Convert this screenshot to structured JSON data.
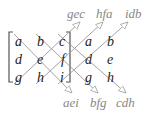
{
  "diagram": {
    "matrix": [
      [
        "a",
        "b",
        "c"
      ],
      [
        "d",
        "e",
        "f"
      ],
      [
        "g",
        "h",
        "i"
      ]
    ],
    "extra_columns": [
      [
        "a",
        "b"
      ],
      [
        "d",
        "e"
      ],
      [
        "g",
        "h"
      ]
    ],
    "positive_diagonals": [
      "aei",
      "bfg",
      "cdh"
    ],
    "negative_diagonals": [
      "gec",
      "hfa",
      "idb"
    ],
    "colors": {
      "letters": "#222222",
      "arrows": "#999999",
      "labels": "#888888",
      "bracket": "#555555"
    }
  }
}
